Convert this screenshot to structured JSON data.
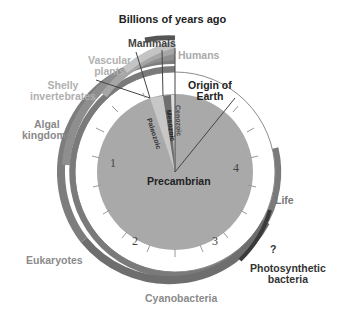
{
  "title": "Billions of years ago",
  "center_label": "Precambrian",
  "dial_numbers": [
    "1",
    "2",
    "3",
    "4"
  ],
  "eras": [
    "Paleozoic",
    "Mesozoic",
    "Cenozoic"
  ],
  "labels": {
    "mammals": "Mammals",
    "humans": "Humans",
    "vascular": "Vascular\nplants",
    "shelly": "Shelly\ninvertebrates",
    "algal": "Algal\nkingdoms",
    "origin": "Origin of\nEarth",
    "life": "Life",
    "question": "?",
    "photo": "Photosynthetic\nbacteria",
    "eukaryotes": "Eukaryotes",
    "cyano": "Cyanobacteria"
  },
  "colors": {
    "disk": "#a9a9a9",
    "band_dark": "#6e6e6e",
    "band_mid": "#8c8c8c",
    "band_light": "#b4b4b4",
    "band_vlight": "#cfcfcf",
    "text_dark": "#222222",
    "text_gray": "#8a8a8a",
    "text_light": "#b0b0b0"
  }
}
